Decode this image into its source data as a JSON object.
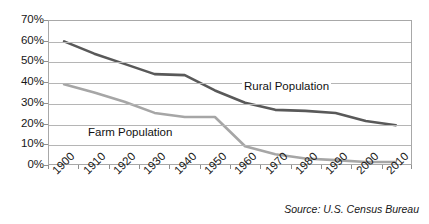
{
  "chart_data": {
    "type": "line",
    "title": "",
    "subtitle": "",
    "xlabel": "",
    "ylabel": "",
    "categories": [
      "1900",
      "1910",
      "1920",
      "1930",
      "1940",
      "1950",
      "1960",
      "1970",
      "1980",
      "1990",
      "2000",
      "2010"
    ],
    "ylim": [
      0,
      70
    ],
    "ytick_labels": [
      "70%",
      "60%",
      "50%",
      "40%",
      "30%",
      "20%",
      "10%",
      "0%"
    ],
    "ytick_values": [
      70,
      60,
      50,
      40,
      30,
      20,
      10,
      0
    ],
    "grid": "horizontal",
    "legend_position": "inline-annotation",
    "series": [
      {
        "name": "Rural Population",
        "color": "#595959",
        "values": [
          60,
          54,
          49,
          44,
          43.5,
          36,
          30,
          26.5,
          26,
          25,
          21,
          19
        ]
      },
      {
        "name": "Farm Population",
        "color": "#a6a6a6",
        "values": [
          39,
          35,
          30.5,
          25,
          23,
          23,
          8.7,
          4.8,
          2.7,
          1.9,
          1.0,
          1.0
        ]
      }
    ],
    "annotations": [
      {
        "text": "Rural Population",
        "series": "Rural Population"
      },
      {
        "text": "Farm Population",
        "series": "Farm Population"
      }
    ],
    "source_note": "Source: U.S. Census Bureau"
  }
}
